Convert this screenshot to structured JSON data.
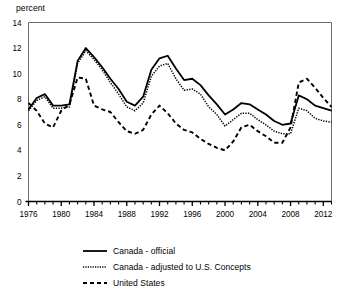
{
  "chart_data": {
    "type": "line",
    "title": "",
    "subtitle": "",
    "xlabel": "",
    "ylabel": "percent",
    "xlim": [
      1976,
      2013
    ],
    "ylim": [
      0,
      14
    ],
    "ytick_step": 2,
    "yticks": [
      "0",
      "2",
      "4",
      "6",
      "8",
      "10",
      "12",
      "14"
    ],
    "xticks_labeled": [
      "1976",
      "1980",
      "1984",
      "1988",
      "1992",
      "1996",
      "2000",
      "2004",
      "2008",
      "2012"
    ],
    "xtick_interval_minor": 1,
    "grid": false,
    "legend_position": "below",
    "x": [
      1976,
      1977,
      1978,
      1979,
      1980,
      1981,
      1982,
      1983,
      1984,
      1985,
      1986,
      1987,
      1988,
      1989,
      1990,
      1991,
      1992,
      1993,
      1994,
      1995,
      1996,
      1997,
      1998,
      1999,
      2000,
      2001,
      2002,
      2003,
      2004,
      2005,
      2006,
      2007,
      2008,
      2009,
      2010,
      2011,
      2012,
      2013
    ],
    "series": [
      {
        "name": "Canada - official",
        "style": "solid",
        "color": "#000000",
        "values": [
          7.2,
          8.1,
          8.4,
          7.5,
          7.5,
          7.6,
          11.0,
          12.0,
          11.3,
          10.5,
          9.6,
          8.8,
          7.8,
          7.5,
          8.2,
          10.3,
          11.2,
          11.4,
          10.4,
          9.5,
          9.6,
          9.1,
          8.3,
          7.6,
          6.8,
          7.2,
          7.7,
          7.6,
          7.2,
          6.8,
          6.3,
          6.0,
          6.1,
          8.3,
          8.0,
          7.5,
          7.3,
          7.1
        ],
        "peak_label": "12.0 in 1983"
      },
      {
        "name": "Canada - adjusted to U.S. Concepts",
        "style": "dotted",
        "color": "#000000",
        "values": [
          7.1,
          7.9,
          8.2,
          7.3,
          7.3,
          7.4,
          10.8,
          11.8,
          11.1,
          10.3,
          9.3,
          8.4,
          7.4,
          7.1,
          7.7,
          9.8,
          10.6,
          10.8,
          9.6,
          8.7,
          8.8,
          8.4,
          7.4,
          6.8,
          5.9,
          6.4,
          6.9,
          6.9,
          6.4,
          6.0,
          5.5,
          5.3,
          5.3,
          7.3,
          7.1,
          6.5,
          6.3,
          6.2
        ]
      },
      {
        "name": "United States",
        "style": "dashed",
        "color": "#000000",
        "values": [
          7.7,
          7.1,
          6.1,
          5.8,
          7.1,
          7.6,
          9.7,
          9.6,
          7.5,
          7.2,
          7.0,
          6.2,
          5.5,
          5.3,
          5.6,
          6.8,
          7.5,
          6.9,
          6.1,
          5.6,
          5.4,
          4.9,
          4.5,
          4.2,
          4.0,
          4.7,
          5.8,
          6.0,
          5.5,
          5.1,
          4.6,
          4.6,
          5.8,
          9.3,
          9.6,
          8.9,
          8.1,
          7.4
        ]
      }
    ]
  },
  "axis": {
    "y_axis_label": "percent"
  },
  "legend": {
    "items": [
      {
        "label": "Canada - official",
        "style": "solid"
      },
      {
        "label": "Canada - adjusted to U.S. Concepts",
        "style": "dotted"
      },
      {
        "label": "United States",
        "style": "dashed"
      }
    ]
  }
}
